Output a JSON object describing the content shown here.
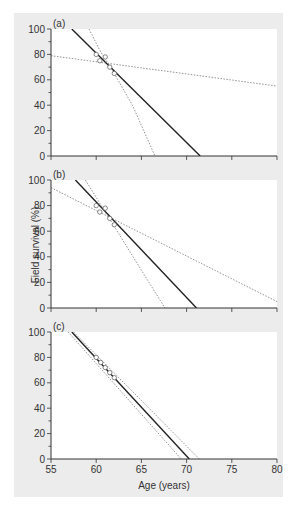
{
  "figure": {
    "background_color": "#ececec",
    "plot_background": "#ffffff",
    "ylabel": "Field survival (%)",
    "xlabel": "Age (years)",
    "caption_fragment": ""
  },
  "chart_data": [
    {
      "type": "line",
      "panel_label": "(a)",
      "xlabel": "",
      "ylabel": "Field survival (%)",
      "xlim": [
        55,
        80
      ],
      "ylim": [
        0,
        100
      ],
      "xticks": [
        55,
        60,
        65,
        70,
        75,
        80
      ],
      "yticks": [
        0,
        20,
        40,
        60,
        80,
        100
      ],
      "grid": false,
      "points": {
        "x": [
          60.0,
          61.0,
          60.4,
          61.5,
          62.0
        ],
        "y": [
          80,
          78,
          75,
          70,
          65
        ],
        "marker": "open-circle"
      },
      "series": [
        {
          "name": "fit",
          "style": "solid",
          "x": [
            57.3,
            71.5
          ],
          "y": [
            100,
            0
          ]
        },
        {
          "name": "upper-bound",
          "style": "dashed",
          "x": [
            55,
            80
          ],
          "y": [
            79,
            55
          ]
        },
        {
          "name": "lower-bound",
          "style": "dashed",
          "x": [
            59.2,
            60.5,
            62.0,
            64.0,
            66.5
          ],
          "y": [
            100,
            82,
            65,
            40,
            0
          ]
        }
      ]
    },
    {
      "type": "line",
      "panel_label": "(b)",
      "xlabel": "",
      "ylabel": "Field survival (%)",
      "xlim": [
        55,
        80
      ],
      "ylim": [
        0,
        100
      ],
      "xticks": [
        55,
        60,
        65,
        70,
        75,
        80
      ],
      "yticks": [
        0,
        20,
        40,
        60,
        80,
        100
      ],
      "grid": false,
      "points": {
        "x": [
          60.0,
          61.0,
          60.4,
          61.5,
          62.0
        ],
        "y": [
          80,
          78,
          75,
          70,
          65
        ],
        "marker": "open-circle"
      },
      "series": [
        {
          "name": "fit",
          "style": "solid",
          "x": [
            57.7,
            71.1
          ],
          "y": [
            100,
            0
          ]
        },
        {
          "name": "upper-bound",
          "style": "dashed",
          "x": [
            55,
            80
          ],
          "y": [
            94,
            5
          ]
        },
        {
          "name": "lower-bound",
          "style": "dashed",
          "x": [
            58.8,
            67.6
          ],
          "y": [
            100,
            0
          ]
        }
      ]
    },
    {
      "type": "line",
      "panel_label": "(c)",
      "xlabel": "Age (years)",
      "ylabel": "Field survival (%)",
      "xlim": [
        55,
        80
      ],
      "ylim": [
        0,
        100
      ],
      "xticks": [
        55,
        60,
        65,
        70,
        75,
        80
      ],
      "yticks": [
        0,
        20,
        40,
        60,
        80,
        100
      ],
      "grid": false,
      "points": {
        "x": [
          60.0,
          60.5,
          61.0,
          61.5,
          62.0
        ],
        "y": [
          80,
          76,
          72,
          68,
          64
        ],
        "marker": "open-circle"
      },
      "series": [
        {
          "name": "fit",
          "style": "solid",
          "x": [
            57.3,
            70.3
          ],
          "y": [
            100,
            0
          ]
        },
        {
          "name": "lower-bound",
          "style": "dashed",
          "x": [
            56.9,
            69.4
          ],
          "y": [
            100,
            0
          ]
        },
        {
          "name": "upper-bound",
          "style": "dashed",
          "x": [
            57.5,
            71.4
          ],
          "y": [
            100,
            0
          ]
        }
      ]
    }
  ]
}
